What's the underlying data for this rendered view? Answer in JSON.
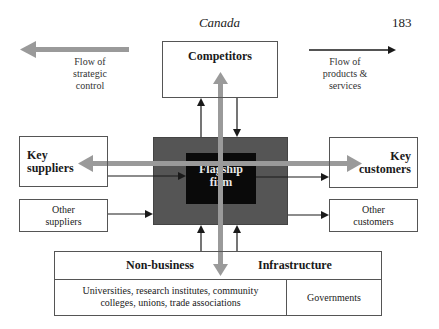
{
  "header": {
    "title": "Canada",
    "page_number": "183"
  },
  "legend": {
    "strategic_control": {
      "label_lines": [
        "Flow of",
        "strategic",
        "control"
      ],
      "arrow_color": "#9a9a9a",
      "direction": "left"
    },
    "products_services": {
      "label_lines": [
        "Flow of",
        "products &",
        "services"
      ],
      "arrow_color": "#222222",
      "direction": "right"
    }
  },
  "nodes": {
    "competitors": {
      "label": "Competitors"
    },
    "flagship": {
      "label_lines": [
        "Flagship",
        "firm"
      ],
      "inner_color": "#0a0a0a",
      "outer_color": "#555555"
    },
    "key_suppliers": {
      "label_lines": [
        "Key",
        "suppliers"
      ]
    },
    "other_suppliers": {
      "label_lines": [
        "Other",
        "suppliers"
      ]
    },
    "key_customers": {
      "label_lines": [
        "Key",
        "customers"
      ]
    },
    "other_customers": {
      "label_lines": [
        "Other",
        "customers"
      ]
    },
    "infrastructure": {
      "header_left": "Non-business",
      "header_right": "Infrastructure",
      "cell_left_lines": [
        "Universities, research institutes, community",
        "colleges, unions, trade associations"
      ],
      "cell_right": "Governments"
    }
  }
}
